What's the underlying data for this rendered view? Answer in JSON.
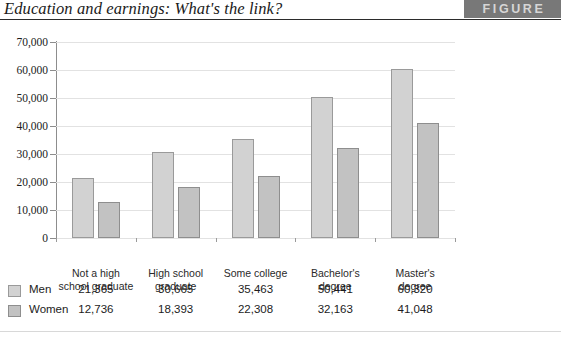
{
  "header": {
    "title": "Education and earnings: What's the link?",
    "badge_label": "FIGURE",
    "badge_color": "#787878",
    "badge_text_color": "#d6d6d6"
  },
  "chart_data": {
    "type": "bar",
    "title": "Education and earnings: What's the link?",
    "xlabel": "",
    "ylabel": "",
    "ylim": [
      0,
      70000
    ],
    "grid": true,
    "legend_position": "bottom-table",
    "categories": [
      "Not a high school graduate",
      "High school graduate",
      "Some college",
      "Bachelor's degree",
      "Master's degree"
    ],
    "category_lines": [
      [
        "Not a high",
        "school graduate"
      ],
      [
        "High school",
        "graduate"
      ],
      [
        "Some college",
        ""
      ],
      [
        "Bachelor's",
        "degree"
      ],
      [
        "Master's",
        "degree"
      ]
    ],
    "ticks": [
      "0",
      "10,000",
      "20,000",
      "30,000",
      "40,000",
      "50,000",
      "60,000",
      "70,000"
    ],
    "tick_values": [
      0,
      10000,
      20000,
      30000,
      40000,
      50000,
      60000,
      70000
    ],
    "series": [
      {
        "name": "Men",
        "color": "#d2d2d2",
        "border_color": "#9a9a9a",
        "values": [
          21365,
          30665,
          35463,
          50441,
          60320
        ],
        "labels": [
          "21,365",
          "30,665",
          "35,463",
          "50,441",
          "60,320"
        ]
      },
      {
        "name": "Women",
        "color": "#c2c2c2",
        "border_color": "#8e8e8e",
        "values": [
          12736,
          18393,
          22308,
          32163,
          41048
        ],
        "labels": [
          "12,736",
          "18,393",
          "22,308",
          "32,163",
          "41,048"
        ]
      }
    ]
  }
}
